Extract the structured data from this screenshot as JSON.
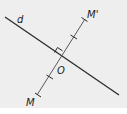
{
  "diagram": {
    "background_color": "#eeeeee",
    "line_color": "#2a2a2a",
    "segment_color": "#555555",
    "labels": {
      "line": "d",
      "point_m": "M",
      "point_m_prime": "M'",
      "point_o": "O"
    },
    "geometry": {
      "line_d": {
        "x1": 5,
        "y1": 17,
        "x2": 119,
        "y2": 95
      },
      "segment_mm": {
        "x1": 37,
        "y1": 95,
        "x2": 85,
        "y2": 19
      },
      "point_o": {
        "x": 61,
        "y": 57
      },
      "right_angle_marker": true,
      "equal_marks": 2
    }
  }
}
